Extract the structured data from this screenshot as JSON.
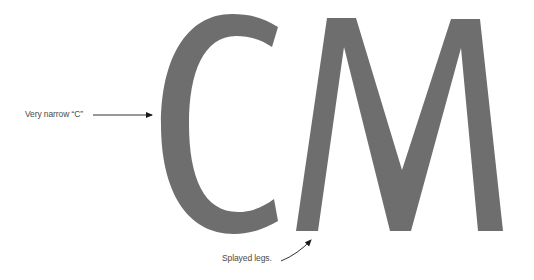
{
  "specimen": {
    "letters": [
      "C",
      "M"
    ],
    "glyph_color": "#6e6e6e",
    "arrow_color": "#1a1a1a"
  },
  "annotations": [
    {
      "label": "Very narrow “C”",
      "target": "C"
    },
    {
      "label": "Splayed legs.",
      "target": "M"
    }
  ]
}
